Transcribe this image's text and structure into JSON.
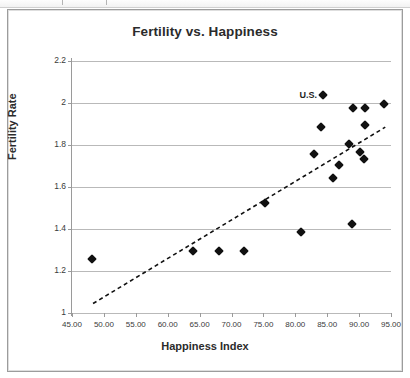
{
  "chart_data": {
    "type": "scatter",
    "title": "Fertility vs. Happiness",
    "xlabel": "Happiness Index",
    "ylabel": "Fertility Rate",
    "xlim": [
      45,
      95
    ],
    "ylim": [
      1,
      2.2
    ],
    "grid": true,
    "legend": "none",
    "x_ticks": [
      "45.00",
      "50.00",
      "55.00",
      "60.00",
      "65.00",
      "70.00",
      "75.00",
      "80.00",
      "85.00",
      "90.00",
      "95.00"
    ],
    "x_tick_values": [
      45,
      50,
      55,
      60,
      65,
      70,
      75,
      80,
      85,
      90,
      95
    ],
    "y_ticks": [
      "1",
      "1.2",
      "1.4",
      "1.6",
      "1.8",
      "2",
      "2.2"
    ],
    "y_tick_values": [
      1,
      1.2,
      1.4,
      1.6,
      1.8,
      2,
      2.2
    ],
    "marker": "diamond",
    "marker_color": "#111111",
    "points": [
      {
        "x": 48.2,
        "y": 1.255
      },
      {
        "x": 64.0,
        "y": 1.295
      },
      {
        "x": 68.0,
        "y": 1.295
      },
      {
        "x": 72.0,
        "y": 1.295
      },
      {
        "x": 75.2,
        "y": 1.525
      },
      {
        "x": 80.9,
        "y": 1.385
      },
      {
        "x": 83.0,
        "y": 1.755
      },
      {
        "x": 84.1,
        "y": 1.885
      },
      {
        "x": 84.3,
        "y": 2.04,
        "label": "U.S."
      },
      {
        "x": 85.9,
        "y": 1.645
      },
      {
        "x": 86.9,
        "y": 1.705
      },
      {
        "x": 88.4,
        "y": 1.805
      },
      {
        "x": 88.9,
        "y": 1.425
      },
      {
        "x": 89.1,
        "y": 1.975
      },
      {
        "x": 90.2,
        "y": 1.765
      },
      {
        "x": 90.7,
        "y": 1.735
      },
      {
        "x": 90.9,
        "y": 1.895
      },
      {
        "x": 90.9,
        "y": 1.975
      },
      {
        "x": 93.9,
        "y": 1.995
      }
    ],
    "annotations": [
      {
        "text": "U.S.",
        "x": 83.4,
        "y": 2.04,
        "anchor": "right"
      }
    ],
    "trendline": {
      "style": "dashed",
      "color": "#111111",
      "x0": 48.3,
      "y0": 1.045,
      "x1": 94.1,
      "y1": 1.885
    }
  }
}
